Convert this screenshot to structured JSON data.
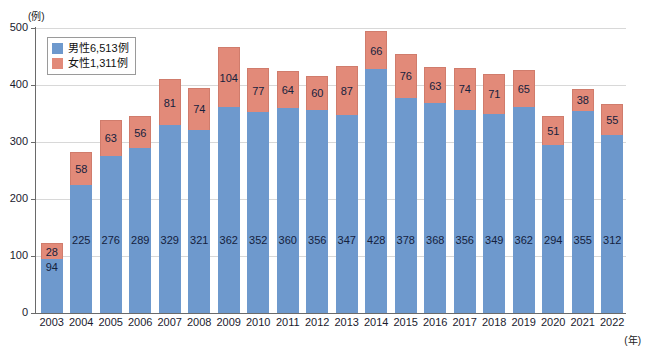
{
  "chart_data": {
    "type": "bar",
    "subtype": "stacked-vertical",
    "title": "",
    "xlabel": "(年)",
    "ylabel": "(例)",
    "ylim": [
      0,
      500
    ],
    "ytick_step": 100,
    "yticks": [
      0,
      100,
      200,
      300,
      400,
      500
    ],
    "grid": true,
    "legend_position": "top-left-inside",
    "categories": [
      "2003",
      "2004",
      "2005",
      "2006",
      "2007",
      "2008",
      "2009",
      "2010",
      "2011",
      "2012",
      "2013",
      "2014",
      "2015",
      "2016",
      "2017",
      "2018",
      "2019",
      "2020",
      "2021",
      "2022"
    ],
    "series": [
      {
        "name": "男性6,513例",
        "short_name": "男性",
        "color": "#6e99cd",
        "total": 6513,
        "values": [
          94,
          225,
          276,
          289,
          329,
          321,
          362,
          352,
          360,
          356,
          347,
          428,
          378,
          368,
          356,
          349,
          362,
          294,
          355,
          312
        ]
      },
      {
        "name": "女性1,311例",
        "short_name": "女性",
        "color": "#e28a79",
        "total": 1311,
        "values": [
          28,
          58,
          63,
          56,
          81,
          74,
          104,
          77,
          64,
          60,
          87,
          66,
          76,
          63,
          74,
          71,
          65,
          51,
          38,
          55
        ]
      }
    ]
  },
  "axis": {
    "unit_top": "(例)",
    "unit_right": "(年)",
    "ytick_labels": [
      "500",
      "400",
      "300",
      "200",
      "100",
      "0"
    ]
  },
  "legend": {
    "items": [
      {
        "label": "男性6,513例",
        "color": "#6e99cd",
        "swatch": "male"
      },
      {
        "label": "女性1,311例",
        "color": "#e28a79",
        "swatch": "female"
      }
    ]
  },
  "colors": {
    "male": "#6e99cd",
    "female": "#e28a79",
    "grid": "#d8d8d8",
    "axis": "#6a6a6a",
    "text": "#1a1a2e",
    "background": "#ffffff"
  }
}
